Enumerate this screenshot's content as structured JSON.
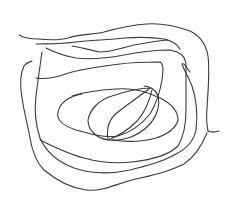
{
  "sketch": {
    "width": 233,
    "height": 208,
    "background": "#ffffff",
    "stroke_color": "#3a3a3a",
    "stroke_width": 1.1,
    "strokes": [
      {
        "name": "outer-top-left-tail",
        "d": "M19,35 C24,38 30,39 38,39 C48,40 58,41 68,38 C80,34 92,35 104,32 C118,28 132,25 146,24 C160,23 176,26 190,31 C200,36 206,44 208,56 C210,72 208,90 207,108 C206,118 207,126 208,131"
      },
      {
        "name": "right-hook-tip",
        "d": "M208,131 C212,133 216,132 219,131"
      },
      {
        "name": "outer-right-down-bottom",
        "d": "M207,133 C202,145 196,156 184,164 C168,172 150,176 132,180 C116,184 102,192 86,190 C70,188 56,180 44,170 C36,162 32,150 30,138 C28,126 24,112 22,98 C20,86 20,74 24,66 C27,62 30,62 32,61"
      },
      {
        "name": "second-loop-top",
        "d": "M36,44 C50,44 62,44 76,42 C92,40 110,40 124,38 C138,37 152,37 164,39 C172,41 178,45 180,49"
      },
      {
        "name": "second-loop-left-right",
        "d": "M42,52 C40,66 38,80 36,96 C34,112 36,126 40,138 C46,152 58,162 74,168 C92,174 112,174 130,170 C146,166 162,162 176,154 C188,148 194,140 196,130 C198,114 196,98 192,86 C188,76 184,70 182,64 C184,62 188,70 190,72"
      },
      {
        "name": "third-loop-top",
        "d": "M46,48 C54,52 64,56 76,58 C92,60 108,58 124,55 C140,52 156,50 170,50 C180,52 186,56 186,66"
      },
      {
        "name": "third-loop-inner",
        "d": "M72,46 C84,48 90,50 100,52 C114,52 126,46 140,44 C152,42 162,40 168,40"
      },
      {
        "name": "third-loop-down",
        "d": "M186,66 C186,80 186,96 186,110 C186,124 184,136 178,146 C168,156 150,160 132,162 C114,164 98,162 84,158 C68,154 52,146 40,140"
      },
      {
        "name": "fourth-loop",
        "d": "M36,78 C48,80 60,76 72,72 C88,68 104,66 120,64 C134,62 150,62 160,62 C164,64 163,72 162,80 C160,92 156,104 150,114 C142,124 132,132 118,136 C104,138 90,134 76,130 C64,126 56,120 58,112 C60,102 70,96 82,94"
      },
      {
        "name": "fifth-loop",
        "d": "M72,96 C84,92 100,90 116,89 C132,88 148,92 160,98 C172,104 178,112 178,120 C176,128 168,134 156,138 C142,142 126,142 112,140"
      },
      {
        "name": "inner-loop",
        "d": "M150,88 C138,88 124,92 112,96 C98,100 90,110 88,120 C88,130 96,138 108,140 C122,142 138,136 148,126 C158,116 160,104 158,96 C156,90 150,86 144,86"
      },
      {
        "name": "inner-leaf",
        "d": "M150,88 C140,96 128,104 118,112 C110,118 106,128 108,140 C118,136 128,130 136,122 C144,114 150,100 152,90"
      }
    ]
  }
}
